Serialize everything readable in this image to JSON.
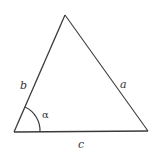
{
  "diagram": {
    "type": "triangle",
    "vertices": {
      "A": {
        "x": 14,
        "y": 132
      },
      "B": {
        "x": 148,
        "y": 131
      },
      "C": {
        "x": 65,
        "y": 15
      }
    },
    "sides": {
      "a": "a",
      "b": "b",
      "c": "c"
    },
    "angle": {
      "label": "α",
      "vertex": "A"
    },
    "colors": {
      "line": "#3a3a3a",
      "label": "#333333",
      "background": "#ffffff"
    }
  }
}
